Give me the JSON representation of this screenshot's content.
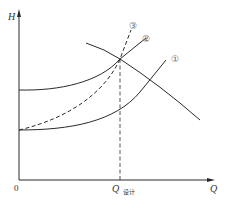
{
  "diagram": {
    "type": "pump-system-characteristic-curves",
    "axes": {
      "y_label": "H",
      "x_label": "Q",
      "origin_label": "0",
      "design_point_label_main": "Q",
      "design_point_label_sub": "设计"
    },
    "curves": [
      {
        "id": "pump",
        "label": "",
        "style": "solid",
        "description": "pump H-Q curve (falling)"
      },
      {
        "id": "system-1",
        "label": "①",
        "style": "solid",
        "description": "system curve, low static head"
      },
      {
        "id": "system-2",
        "label": "②",
        "style": "solid",
        "description": "system curve, high static head"
      },
      {
        "id": "system-3",
        "label": "③",
        "style": "dashed",
        "description": "steep system curve through design point"
      }
    ],
    "guides": [
      {
        "id": "design-flow-line",
        "style": "dashed",
        "description": "vertical line from design point down to Q设计"
      }
    ],
    "colors": {
      "line": "#2a2a2a",
      "label": "#666666",
      "background": "#ffffff"
    }
  }
}
